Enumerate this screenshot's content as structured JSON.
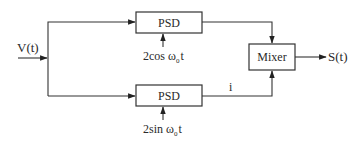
{
  "diagram": {
    "type": "block-diagram",
    "input": {
      "label": "V(t)"
    },
    "output": {
      "label": "S(t)"
    },
    "blocks": {
      "psd_top": {
        "label": "PSD"
      },
      "psd_bottom": {
        "label": "PSD"
      },
      "mixer": {
        "label": "Mixer"
      }
    },
    "references": {
      "top": {
        "prefix": "2cos ω",
        "subscript": "0",
        "suffix": "t"
      },
      "bottom": {
        "prefix": "2sin ω",
        "subscript": "0",
        "suffix": "t"
      }
    },
    "signals": {
      "bottom_branch": "i"
    },
    "colors": {
      "line": "#333333",
      "text": "#2a2a2a",
      "background": "#ffffff"
    }
  }
}
